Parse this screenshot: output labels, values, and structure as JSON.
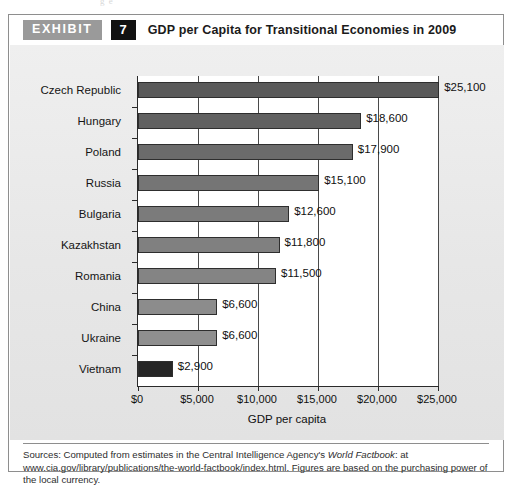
{
  "page": {
    "top_bleed_text": "g                              e"
  },
  "header": {
    "exhibit_label": "EXHIBIT",
    "exhibit_number": "7",
    "title": "GDP per Capita for Transitional Economies in 2009",
    "label_bg": "#9a9a9a",
    "number_bg": "#111111"
  },
  "source_note": {
    "prefix": "Sources: Computed from estimates in the Central Intelligence Agency's ",
    "italic": "World Factbook",
    "suffix": ": at www.cia.gov/library/publications/the-world-factbook/index.html. Figures are based on the purchasing power of the local currency."
  },
  "chart_data": {
    "type": "bar",
    "orientation": "horizontal",
    "title": "GDP per Capita for Transitional Economies in 2009",
    "xlabel": "GDP per capita",
    "ylabel": "",
    "xlim": [
      0,
      25000
    ],
    "xticks": [
      0,
      5000,
      10000,
      15000,
      20000,
      25000
    ],
    "xtick_labels": [
      "$0",
      "$5,000",
      "$10,000",
      "$15,000",
      "$20,000",
      "$25,000"
    ],
    "grid": true,
    "legend": null,
    "categories": [
      "Czech Republic",
      "Hungary",
      "Poland",
      "Russia",
      "Bulgaria",
      "Kazakhstan",
      "Romania",
      "China",
      "Ukraine",
      "Vietnam"
    ],
    "values": [
      25100,
      18600,
      17900,
      15100,
      12600,
      11800,
      11500,
      6600,
      6600,
      2900
    ],
    "value_labels": [
      "$25,100",
      "$18,600",
      "$17,900",
      "$15,100",
      "$12,600",
      "$11,800",
      "$11,500",
      "$6,600",
      "$6,600",
      "$2,900"
    ],
    "bar_colors": [
      "#5a5a5a",
      "#616161",
      "#6b6b6b",
      "#757575",
      "#7b7b7b",
      "#808080",
      "#848484",
      "#8c8c8c",
      "#8f8f8f",
      "#262626"
    ]
  }
}
